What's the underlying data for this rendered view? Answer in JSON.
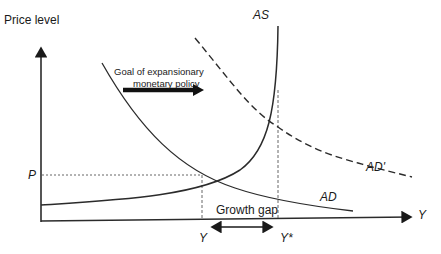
{
  "diagram": {
    "type": "economics AS-AD diagram",
    "axes": {
      "y_axis_title": "Price level",
      "x_axis_symbol": "Y"
    },
    "curves": {
      "as_label": "AS",
      "ad_label": "AD",
      "ad_prime_label": "AD'"
    },
    "annotations": {
      "policy_arrow_line1": "Goal of expansionary",
      "policy_arrow_line2": "monetary policy",
      "gap_label": "Growth gap",
      "price_marker": "P",
      "output_marker": "Y",
      "potential_output_marker": "Y*"
    },
    "colors": {
      "line": "#2b2b2b",
      "guide": "#555555",
      "background": "#ffffff"
    }
  }
}
